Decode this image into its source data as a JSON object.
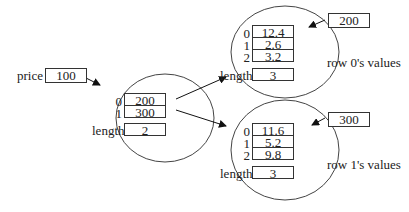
{
  "price": {
    "label": "price",
    "value": "100"
  },
  "outer_array": {
    "indices": [
      "0",
      "1"
    ],
    "cells": [
      "200",
      "300"
    ],
    "length_label": "length",
    "length": "2"
  },
  "row0": {
    "ref": "200",
    "indices": [
      "0",
      "1",
      "2"
    ],
    "cells": [
      "12.4",
      "2.6",
      "3.2"
    ],
    "length_label": "length",
    "length": "3",
    "caption": "row 0's values"
  },
  "row1": {
    "ref": "300",
    "indices": [
      "0",
      "1",
      "2"
    ],
    "cells": [
      "11.6",
      "5.2",
      "9.8"
    ],
    "length_label": "length",
    "length": "3",
    "caption": "row 1's values"
  }
}
